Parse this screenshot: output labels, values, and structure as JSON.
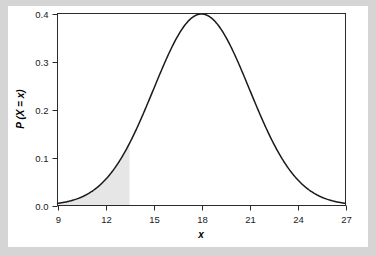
{
  "figure": {
    "background_color": "#d5d5d5",
    "card_color": "#ffffff",
    "frame_color": "#2a2a2a"
  },
  "chart_data": {
    "type": "area",
    "title": "",
    "subtitle": "",
    "xlabel": "x",
    "ylabel": "P (X = x)",
    "xlim": [
      9,
      27
    ],
    "ylim": [
      0.0,
      0.4
    ],
    "xticks": [
      9,
      12,
      15,
      18,
      21,
      24,
      27
    ],
    "xtick_labels": [
      "9",
      "12",
      "15",
      "18",
      "21",
      "24",
      "27"
    ],
    "yticks": [
      0.0,
      0.1,
      0.2,
      0.3,
      0.4
    ],
    "ytick_labels": [
      "0.0",
      "0.1",
      "0.2",
      "0.3",
      "0.4"
    ],
    "grid": false,
    "legend": null,
    "legend_position": "none",
    "curve": {
      "name": "Normal density",
      "distribution": "normal",
      "mean": 18,
      "sigma": 1,
      "peak_value": 0.399,
      "line_color": "#1a1a1a",
      "x": [
        9.0,
        9.5,
        10.0,
        10.5,
        11.0,
        11.5,
        12.0,
        12.5,
        13.0,
        13.5,
        14.0,
        14.5,
        15.0,
        15.5,
        16.0,
        16.5,
        17.0,
        17.5,
        18.0,
        18.5,
        19.0,
        19.5,
        20.0,
        20.5,
        21.0,
        21.5,
        22.0,
        22.5,
        23.0,
        23.5,
        24.0,
        24.5,
        25.0,
        25.5,
        26.0,
        26.5,
        27.0
      ],
      "y": [
        0.0017,
        0.0028,
        0.0044,
        0.0069,
        0.0104,
        0.0154,
        0.0222,
        0.0312,
        0.043,
        0.0579,
        0.0761,
        0.0977,
        0.1226,
        0.1503,
        0.18,
        0.2107,
        0.2409,
        0.2691,
        0.2939,
        0.3139,
        0.3282,
        0.336,
        0.3372,
        0.3319,
        0.3205,
        0.3038,
        0.2827,
        0.2586,
        0.2325,
        0.2056,
        0.179,
        0.1534,
        0.1295,
        0.1077,
        0.0882,
        0.0712,
        0.0566
      ]
    },
    "shaded_area": {
      "label": "Lower tail shaded region",
      "x_from": 9,
      "x_to": 13.5,
      "fill_color": "#e6e6e6"
    },
    "annotations": []
  },
  "axis_titles": {
    "x": "x",
    "y_prefix": "P",
    "y_body": "(X = x)",
    "y_full": "P (X = x)"
  }
}
